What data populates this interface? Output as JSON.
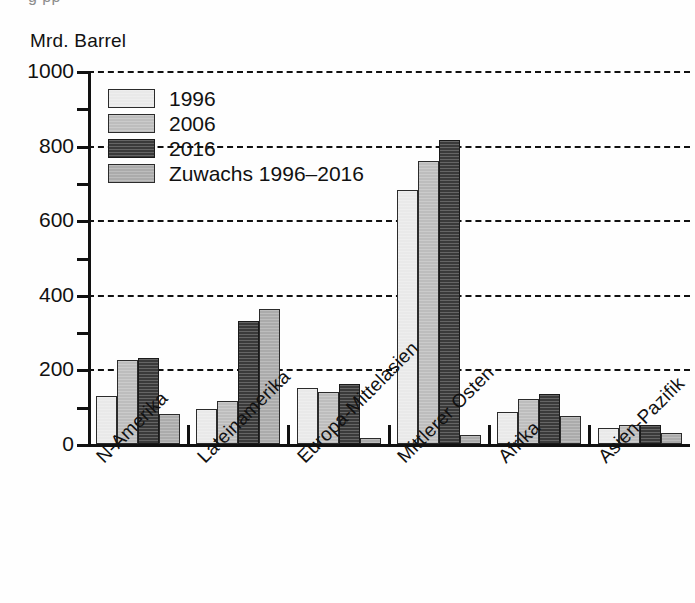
{
  "top_cut_text": "g                               pp",
  "axis_unit_label": "Mrd. Barrel",
  "legend": {
    "items": [
      {
        "label": "1996",
        "color": "#e9e9e9"
      },
      {
        "label": "2006",
        "color": "#bdbdbd"
      },
      {
        "label": "2016",
        "color": "#3a3a3a"
      },
      {
        "label": "Zuwachs 1996–2016",
        "color": "#ababab"
      }
    ]
  },
  "chart_data": {
    "type": "bar",
    "title": "",
    "subtitle": "",
    "xlabel": "",
    "ylabel": "Mrd. Barrel",
    "ylim": [
      0,
      1000
    ],
    "yticks": [
      0,
      200,
      400,
      600,
      800,
      1000
    ],
    "yticks_minor": [
      100,
      300,
      500,
      700,
      900
    ],
    "ytick_labels": [
      "0",
      "200",
      "400",
      "600",
      "800",
      "1000"
    ],
    "grid": true,
    "grid_style": "dashed-horizontal",
    "legend_position": "inside-top-left",
    "categories": [
      "N-Amerika",
      "Lateinamerika",
      "Europa-Mittelasien",
      "Mittlerer Osten",
      "Afrika",
      "Asien-Pazifik"
    ],
    "series": [
      {
        "name": "1996",
        "color": "#e9e9e9",
        "values": [
          130,
          95,
          150,
          680,
          85,
          42
        ]
      },
      {
        "name": "2006",
        "color": "#bdbdbd",
        "values": [
          225,
          115,
          140,
          760,
          120,
          50
        ]
      },
      {
        "name": "2016",
        "color": "#3a3a3a",
        "values": [
          230,
          330,
          160,
          815,
          135,
          52
        ]
      },
      {
        "name": "Zuwachs 1996–2016",
        "color": "#ababab",
        "values": [
          80,
          362,
          15,
          25,
          75,
          30
        ]
      }
    ]
  }
}
